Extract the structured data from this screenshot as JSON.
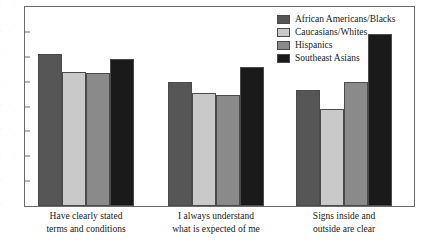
{
  "chart_data": {
    "type": "bar",
    "title": "",
    "xlabel": "",
    "ylabel": "",
    "ylim": [
      0,
      80
    ],
    "yticks": [
      0,
      10,
      20,
      30,
      40,
      50,
      60,
      70,
      80
    ],
    "grid": false,
    "legend_position": "top-right",
    "categories": [
      "Have clearly stated terms and conditions",
      "I always understand what is expected of me",
      "Signs inside and outside are clear"
    ],
    "category_lines": [
      [
        "Have clearly stated",
        "terms and conditions"
      ],
      [
        "I always understand",
        "what is expected of me"
      ],
      [
        "Signs inside and",
        "outside are clear"
      ]
    ],
    "series": [
      {
        "name": "African Americans/Blacks",
        "color": "#565656",
        "values": [
          61,
          50,
          46.5
        ]
      },
      {
        "name": "Caucasians/Whites",
        "color": "#c9c9c9",
        "values": [
          54,
          45.5,
          39
        ]
      },
      {
        "name": "Hispanics",
        "color": "#8a8a8a",
        "values": [
          53.5,
          44.5,
          50
        ]
      },
      {
        "name": "Southeast Asians",
        "color": "#1a1a1a",
        "values": [
          59,
          56,
          69
        ]
      }
    ]
  },
  "axis": {
    "tick_labels": [
      "0",
      "10",
      "20",
      "30",
      "40",
      "50",
      "60",
      "70",
      "80"
    ]
  },
  "legend": {
    "items": [
      {
        "label": "African Americans/Blacks",
        "color": "#565656"
      },
      {
        "label": "Caucasians/Whites",
        "color": "#c9c9c9"
      },
      {
        "label": "Hispanics",
        "color": "#8a8a8a"
      },
      {
        "label": "Southeast Asians",
        "color": "#1a1a1a"
      }
    ]
  },
  "colors": {
    "frame": "#6b6b6b",
    "bar_outline": "#4a4a4a",
    "text": "#1a1a1a",
    "background": "#ffffff"
  }
}
